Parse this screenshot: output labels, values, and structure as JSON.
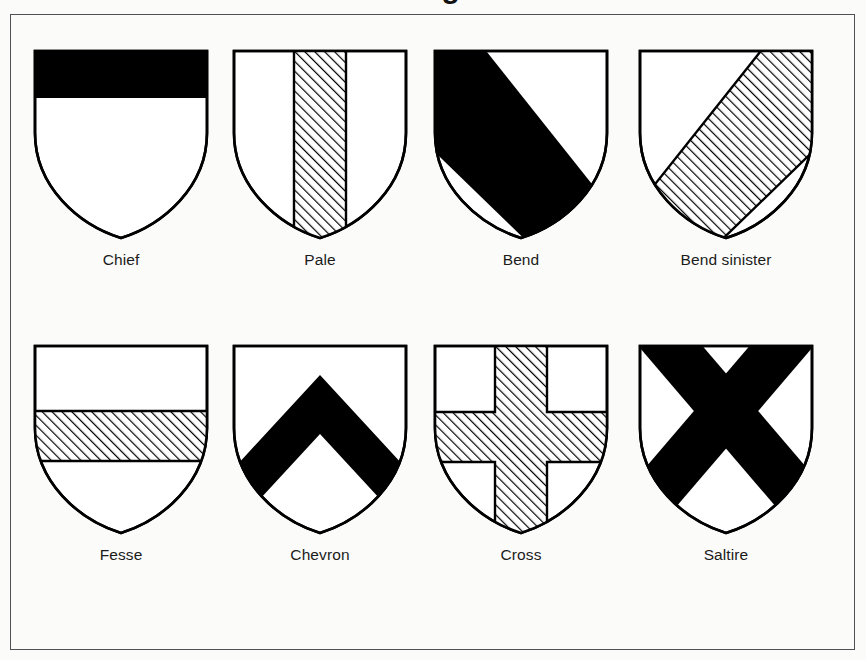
{
  "page": {
    "title_partial": "Charges",
    "background_color": "#fbfbfa",
    "frame_color": "#4d5055"
  },
  "figure": {
    "kind": "heraldic-ordinaries-chart",
    "ink_color": "#000000",
    "field_color": "#ffffff",
    "hatch_color": "#000000",
    "rows": 2,
    "columns": 4
  },
  "shields": [
    {
      "id": "chief",
      "label": "Chief",
      "ordinary": "chief",
      "tincture": "solid-black",
      "row": 1,
      "column": 1,
      "description": "Horizontal band across the top of the shield"
    },
    {
      "id": "pale",
      "label": "Pale",
      "ordinary": "pale",
      "tincture": "hatched",
      "row": 1,
      "column": 2,
      "description": "Vertical band down the centre of the shield"
    },
    {
      "id": "bend",
      "label": "Bend",
      "ordinary": "bend",
      "tincture": "solid-black",
      "row": 1,
      "column": 3,
      "description": "Diagonal band from upper left to lower right"
    },
    {
      "id": "bend-sinister",
      "label": "Bend sinister",
      "ordinary": "bend-sinister",
      "tincture": "hatched",
      "row": 1,
      "column": 4,
      "description": "Diagonal band from lower left to upper right"
    },
    {
      "id": "fesse",
      "label": "Fesse",
      "ordinary": "fesse",
      "tincture": "hatched",
      "row": 2,
      "column": 1,
      "description": "Horizontal band across the middle of the shield"
    },
    {
      "id": "chevron",
      "label": "Chevron",
      "ordinary": "chevron",
      "tincture": "solid-black",
      "row": 2,
      "column": 2,
      "description": "Inverted V shape"
    },
    {
      "id": "cross",
      "label": "Cross",
      "ordinary": "cross",
      "tincture": "hatched",
      "row": 2,
      "column": 3,
      "description": "Vertical and horizontal bands crossing"
    },
    {
      "id": "saltire",
      "label": "Saltire",
      "ordinary": "saltire",
      "tincture": "solid-black",
      "row": 2,
      "column": 4,
      "description": "Diagonal cross in the form of an X"
    }
  ]
}
